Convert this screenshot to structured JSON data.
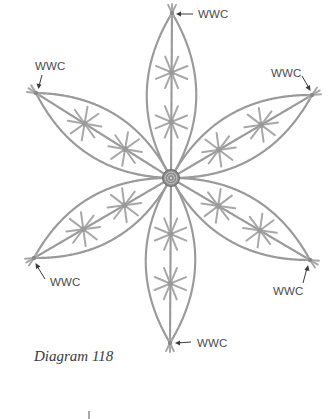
{
  "diagram": {
    "caption": "Diagram 118",
    "center": {
      "x": 171,
      "y": 178
    },
    "stroke_color": "#9a9a9a",
    "label_color": "#4a4a4a",
    "petals": [
      {
        "name": "top",
        "tip": {
          "x": 172,
          "y": 13
        },
        "label": "WWC"
      },
      {
        "name": "upper-right",
        "tip": {
          "x": 312,
          "y": 95
        },
        "label": "WWC"
      },
      {
        "name": "lower-right",
        "tip": {
          "x": 310,
          "y": 260
        },
        "label": "WWC"
      },
      {
        "name": "bottom",
        "tip": {
          "x": 170,
          "y": 343
        },
        "label": "WWC"
      },
      {
        "name": "lower-left",
        "tip": {
          "x": 34,
          "y": 258
        },
        "label": "WWC"
      },
      {
        "name": "upper-left",
        "tip": {
          "x": 36,
          "y": 93
        },
        "label": "WWC"
      }
    ],
    "labels": {
      "top": "WWC",
      "upper_left": "WWC",
      "upper_right": "WWC",
      "lower_left": "WWC",
      "lower_right": "WWC",
      "bottom": "WWC"
    }
  }
}
